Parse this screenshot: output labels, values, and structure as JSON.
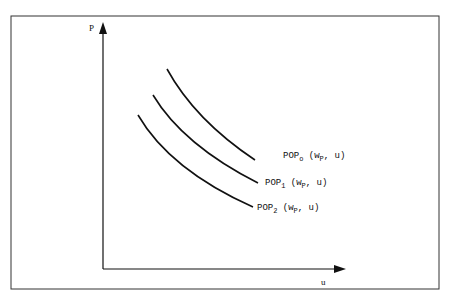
{
  "diagram": {
    "y_axis_label": "P",
    "x_axis_label": "u",
    "curves": [
      {
        "name": "POP",
        "sub": "o",
        "args_pre": " (w",
        "args_sub": "P",
        "args_post": ", u)"
      },
      {
        "name": "POP",
        "sub": "1",
        "args_pre": " (w",
        "args_sub": "P",
        "args_post": ", u)"
      },
      {
        "name": "POP",
        "sub": "2",
        "args_pre": " (w",
        "args_sub": "P",
        "args_post": ", u)"
      }
    ],
    "colors": {
      "line": "#111111",
      "frame": "#333333",
      "background": "#ffffff"
    }
  }
}
